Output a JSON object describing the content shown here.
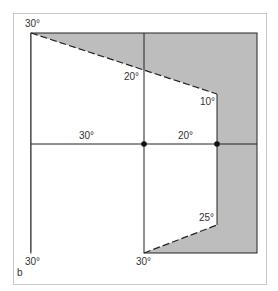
{
  "figure": {
    "panel_label": "b",
    "colors": {
      "frame": "#c8c8c8",
      "shade": "#bdbdbd",
      "line": "#222222",
      "background": "#ffffff"
    },
    "labels": {
      "top_left": "30°",
      "upper_middle": "20°",
      "upper_right": "10°",
      "middle_left": "30°",
      "middle_right": "20°",
      "lower_right": "25°",
      "bottom_left": "30°",
      "bottom_middle": "30°"
    }
  }
}
